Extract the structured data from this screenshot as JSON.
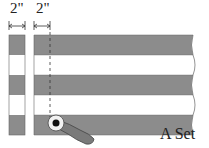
{
  "diagram": {
    "dimensions": [
      {
        "label": "2\"",
        "span": "left strip width"
      },
      {
        "label": "2\"",
        "span": "strip segment width"
      }
    ],
    "caption": "A Set",
    "colors": {
      "band_gray": "#8c8c8c",
      "band_white": "#ffffff",
      "outline": "#555555",
      "tool": "#7a7a7a"
    },
    "bands": [
      "gray",
      "white",
      "gray",
      "white",
      "gray"
    ]
  }
}
